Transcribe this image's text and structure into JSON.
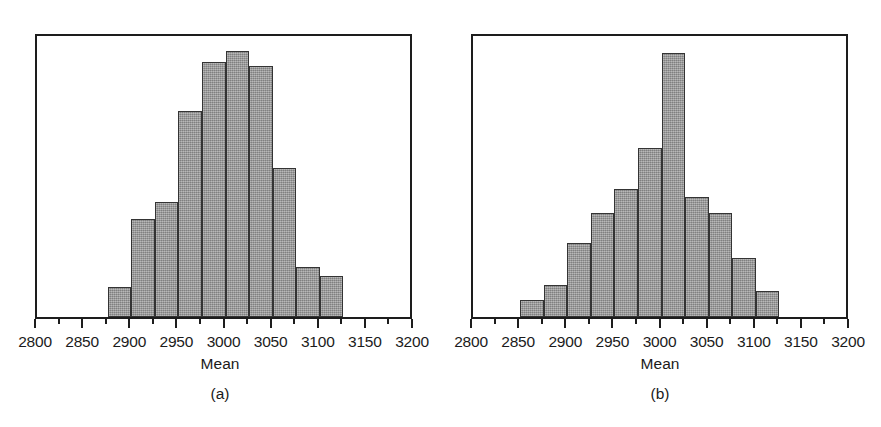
{
  "figure": {
    "background": "#ffffff",
    "bar_fill": "#9d9d9d",
    "bar_edge": "#343434",
    "frame_color": "#1d1d1d",
    "text_color": "#1b1b1b"
  },
  "panels": [
    {
      "caption": "(a)",
      "xlabel": "Mean",
      "tick_labels": [
        "2800",
        "2850",
        "2900",
        "2950",
        "3000",
        "3050",
        "3100",
        "3150",
        "3200"
      ]
    },
    {
      "caption": "(b)",
      "xlabel": "Mean",
      "tick_labels": [
        "2800",
        "2850",
        "2900",
        "2950",
        "3000",
        "3050",
        "3100",
        "3150",
        "3200"
      ]
    }
  ],
  "chart_data": [
    {
      "type": "bar",
      "subtype": "histogram",
      "title": "",
      "panel_label": "(a)",
      "xlabel": "Mean",
      "ylabel": "",
      "xlim": [
        2800,
        3200
      ],
      "ylim": [
        0,
        210
      ],
      "grid": false,
      "legend": null,
      "bin_width": 25,
      "xticks": [
        2800,
        2850,
        2900,
        2950,
        3000,
        3050,
        3100,
        3150,
        3200
      ],
      "xtick_labels": [
        "2800",
        "2850",
        "2900",
        "2950",
        "3000",
        "3050",
        "3100",
        "3150",
        "3200"
      ],
      "minor_xticks": [
        2825,
        2875,
        2925,
        2975,
        3025,
        3075,
        3125,
        3175
      ],
      "yaxis_visible": false,
      "bin_edges": [
        2875,
        2900,
        2925,
        2950,
        2975,
        3000,
        3025,
        3050,
        3075,
        3100,
        3125
      ],
      "categories": [
        "2875-2900",
        "2900-2925",
        "2925-2950",
        "2950-2975",
        "2975-3000",
        "3000-3025",
        "3025-3050",
        "3050-3075",
        "3075-3100",
        "3100-3125"
      ],
      "values": [
        22,
        72,
        85,
        152,
        188,
        196,
        185,
        110,
        37,
        30
      ]
    },
    {
      "type": "bar",
      "subtype": "histogram",
      "title": "",
      "panel_label": "(b)",
      "xlabel": "Mean",
      "ylabel": "",
      "xlim": [
        2800,
        3200
      ],
      "ylim": [
        0,
        240
      ],
      "grid": false,
      "legend": null,
      "bin_width": 25,
      "xticks": [
        2800,
        2850,
        2900,
        2950,
        3000,
        3050,
        3100,
        3150,
        3200
      ],
      "xtick_labels": [
        "2800",
        "2850",
        "2900",
        "2950",
        "3000",
        "3050",
        "3100",
        "3150",
        "3200"
      ],
      "minor_xticks": [
        2825,
        2875,
        2925,
        2975,
        3025,
        3075,
        3125,
        3175
      ],
      "yaxis_visible": false,
      "bin_edges": [
        2850,
        2875,
        2900,
        2925,
        2950,
        2975,
        3000,
        3025,
        3050,
        3075,
        3100,
        3125
      ],
      "categories": [
        "2850-2875",
        "2875-2900",
        "2900-2925",
        "2925-2950",
        "2950-2975",
        "2975-3000",
        "3000-3025",
        "3025-3050",
        "3050-3075",
        "3075-3100",
        "3100-3125"
      ],
      "values": [
        14,
        27,
        62,
        88,
        108,
        142,
        222,
        101,
        88,
        50,
        22
      ]
    }
  ]
}
